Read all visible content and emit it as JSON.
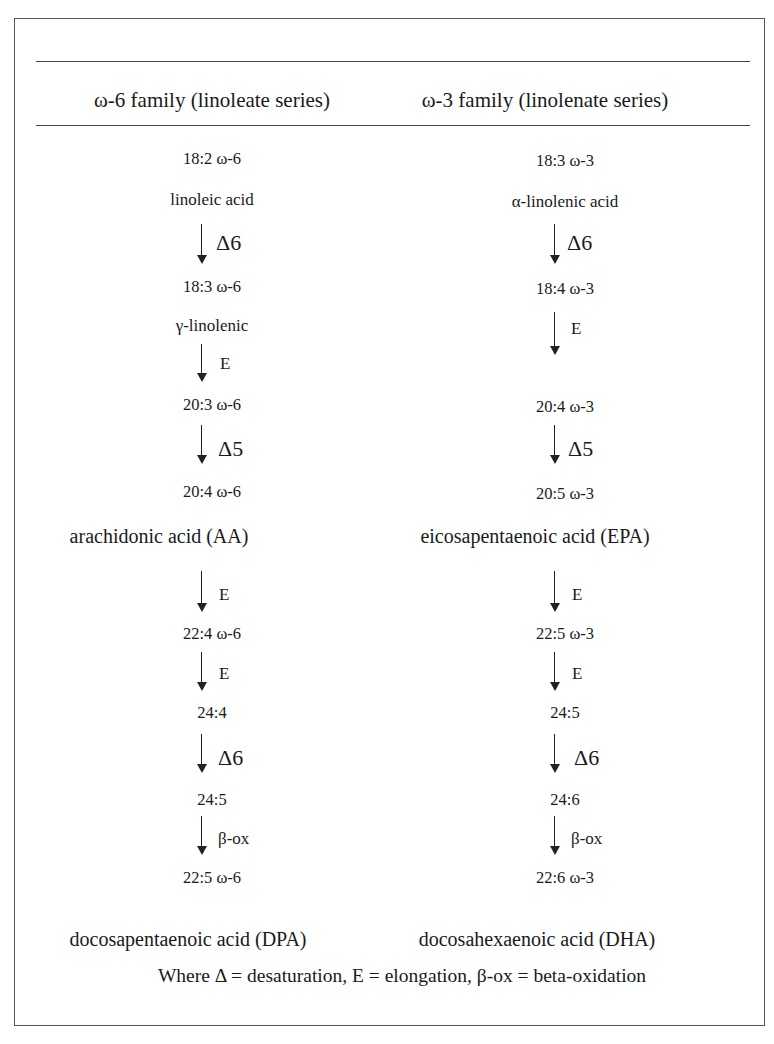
{
  "header": {
    "left": "ω-6 family (linoleate series)",
    "right": "ω-3 family (linolenate series)"
  },
  "omega6": {
    "c1": "18:2 ω-6",
    "n1": "linoleic acid",
    "a1": "Δ6",
    "c2": "18:3 ω-6",
    "n2": "γ-linolenic",
    "a2": "E",
    "c3": "20:3 ω-6",
    "a3": "Δ5",
    "c4": "20:4 ω-6",
    "n4": "arachidonic acid (AA)",
    "a4": "E",
    "c5": "22:4 ω-6",
    "a5": "E",
    "c6": "24:4",
    "a6": "Δ6",
    "c7": "24:5",
    "a7": "β-ox",
    "c8": "22:5 ω-6",
    "n8": "docosapentaenoic acid (DPA)"
  },
  "omega3": {
    "c1": "18:3 ω-3",
    "n1": "α-linolenic acid",
    "a1": "Δ6",
    "c2": "18:4 ω-3",
    "a2": "E",
    "c3": "20:4 ω-3",
    "a3": "Δ5",
    "c4": "20:5 ω-3",
    "n4": "eicosapentaenoic acid (EPA)",
    "a4": "E",
    "c5": "22:5 ω-3",
    "a5": "E",
    "c6": "24:5",
    "a6": "Δ6",
    "c7": "24:6",
    "a7": "β-ox",
    "c8": "22:6 ω-3",
    "n8": "docosahexaenoic acid (DHA)"
  },
  "legend": "Where Δ = desaturation, E = elongation, β-ox = beta-oxidation"
}
